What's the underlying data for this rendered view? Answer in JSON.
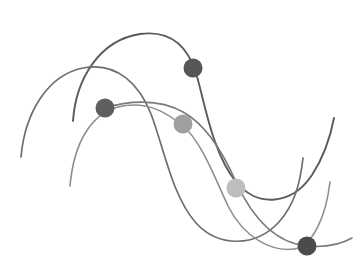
{
  "canvas": {
    "width": 359,
    "height": 278,
    "background": "#ffffff",
    "title": "abstract-line-graph-illustration"
  },
  "chart_data": {
    "type": "line",
    "title": "",
    "subtitle": "",
    "xlabel": "",
    "ylabel": "",
    "grid": false,
    "legend": "none",
    "axis_visible": false,
    "xlim": [
      0,
      359
    ],
    "ylim": [
      0,
      278
    ],
    "note": "Decorative multi-series smooth curve graphic; coordinates are in pixel space with y increasing downward.",
    "series": [
      {
        "name": "series-1-dark",
        "color": "#5c5c5c",
        "stroke_width": 1.9,
        "opacity": 1,
        "path": "M 73 121 C 76 78, 100 40, 140 34 C 176 29, 190 54, 196 73 C 205 103, 212 152, 236 182 C 258 208, 292 205, 312 175 C 325 155, 331 134, 334 118",
        "points": [
          {
            "x": 73,
            "y": 121
          },
          {
            "x": 140,
            "y": 34
          },
          {
            "x": 196,
            "y": 73
          },
          {
            "x": 236,
            "y": 182
          },
          {
            "x": 312,
            "y": 175
          },
          {
            "x": 334,
            "y": 118
          }
        ]
      },
      {
        "name": "series-2-mid",
        "color": "#6e6e6e",
        "stroke_width": 1.7,
        "opacity": 1,
        "path": "M 21 157 C 25 112, 48 75, 83 68 C 118 61, 140 86, 151 114 C 164 148, 172 196, 196 223 C 219 248, 256 247, 279 222 C 294 205, 300 185, 303 158",
        "points": [
          {
            "x": 21,
            "y": 157
          },
          {
            "x": 83,
            "y": 68
          },
          {
            "x": 151,
            "y": 114
          },
          {
            "x": 196,
            "y": 223
          },
          {
            "x": 279,
            "y": 222
          },
          {
            "x": 303,
            "y": 158
          }
        ]
      },
      {
        "name": "series-3-light",
        "color": "#8f8f8f",
        "stroke_width": 1.6,
        "opacity": 1,
        "path": "M 70 186 C 74 141, 92 114, 118 107 C 150 99, 172 117, 183 126 C 201 141, 214 176, 228 206 C 244 238, 272 252, 294 249 C 313 246, 326 216, 330 182",
        "points": [
          {
            "x": 70,
            "y": 186
          },
          {
            "x": 118,
            "y": 107
          },
          {
            "x": 183,
            "y": 126
          },
          {
            "x": 228,
            "y": 206
          },
          {
            "x": 294,
            "y": 249
          },
          {
            "x": 330,
            "y": 182
          }
        ]
      },
      {
        "name": "series-4-mid-light",
        "color": "#7a7a7a",
        "stroke_width": 1.6,
        "opacity": 1,
        "path": "M 105 108 C 127 101, 158 98, 183 112 C 205 124, 222 150, 236 182 C 253 219, 276 243, 307 246 C 330 248, 345 242, 352 238",
        "points": [
          {
            "x": 105,
            "y": 108
          },
          {
            "x": 183,
            "y": 112
          },
          {
            "x": 236,
            "y": 182
          },
          {
            "x": 307,
            "y": 246
          }
        ]
      }
    ],
    "markers": [
      {
        "name": "marker-top-dark",
        "x": 193,
        "y": 68,
        "r": 9.5,
        "color": "#565656",
        "series": "series-1-dark"
      },
      {
        "name": "marker-left-dark",
        "x": 105,
        "y": 108,
        "r": 9.5,
        "color": "#5e5e5e",
        "series": "series-4-mid-light"
      },
      {
        "name": "marker-center-mid",
        "x": 183,
        "y": 124,
        "r": 9.5,
        "color": "#a0a0a0",
        "series": "series-4-mid-light"
      },
      {
        "name": "marker-center-light",
        "x": 236,
        "y": 188,
        "r": 9.5,
        "color": "#bdbdbd",
        "series": "series-1-dark"
      },
      {
        "name": "marker-bottom-dark",
        "x": 307,
        "y": 246,
        "r": 9.5,
        "color": "#4b4b4b",
        "series": "series-4-mid-light"
      }
    ]
  }
}
